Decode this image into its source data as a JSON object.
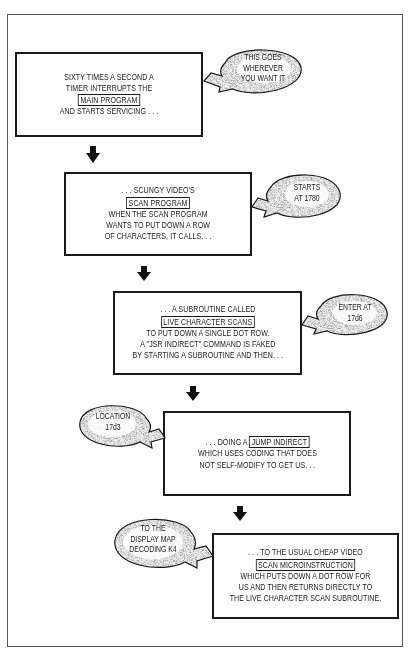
{
  "diagram": {
    "type": "flowchart",
    "steps": [
      {
        "id": "main-program",
        "lines": [
          {
            "text": "SIXTY TIMES A SECOND A"
          },
          {
            "text": "TIMER INTERRUPTS THE"
          },
          {
            "highlight": "MAIN PROGRAM"
          },
          {
            "text": "AND STARTS SERVICING . . ."
          }
        ],
        "callout": [
          "THIS GOES",
          "WHEREVER",
          "YOU WANT IT"
        ],
        "callout_side": "right"
      },
      {
        "id": "scan-program",
        "lines": [
          {
            "text": ". . . SCUNGY VIDEO'S"
          },
          {
            "highlight": "SCAN PROGRAM"
          },
          {
            "text": "WHEN THE SCAN PROGRAM"
          },
          {
            "text": "WANTS TO PUT DOWN A ROW"
          },
          {
            "text": "OF CHARACTERS, IT CALLS. . ."
          }
        ],
        "callout": [
          "STARTS",
          "AT 1780"
        ],
        "callout_side": "right"
      },
      {
        "id": "live-character-scans",
        "lines": [
          {
            "text": ". . . A SUBROUTINE CALLED"
          },
          {
            "highlight": "LIVE CHARACTER SCANS"
          },
          {
            "text": "TO PUT DOWN A SINGLE DOT ROW."
          },
          {
            "text": "A \"JSR INDIRECT\" COMMAND IS FAKED"
          },
          {
            "text": "BY STARTING A SUBROUTINE AND THEN. . ."
          }
        ],
        "callout": [
          "ENTER AT",
          "17d6"
        ],
        "callout_side": "right"
      },
      {
        "id": "jump-indirect",
        "lines": [
          {
            "prefix": ". . . DOING A ",
            "highlight": "JUMP INDIRECT"
          },
          {
            "text": "WHICH USES CODING THAT DOES"
          },
          {
            "text": "NOT SELF-MODIFY TO GET US. . ."
          }
        ],
        "callout": [
          "LOCATION",
          "17d3"
        ],
        "callout_side": "left"
      },
      {
        "id": "scan-microinstruction",
        "lines": [
          {
            "text": ". . . TO THE USUAL CHEAP VIDEO"
          },
          {
            "highlight": "SCAN MICROINSTRUCTION"
          },
          {
            "text": "WHICH PUTS DOWN A DOT ROW FOR"
          },
          {
            "text": "US AND THEN RETURNS DIRECTLY TO"
          },
          {
            "text": "THE LIVE CHARACTER SCAN SUBROUTINE."
          }
        ],
        "callout": [
          "TO THE",
          "DISPLAY MAP",
          "DECODING K4"
        ],
        "callout_side": "left"
      }
    ],
    "connectors": [
      {
        "from": "main-program",
        "to": "scan-program",
        "icon": "down-arrow-icon"
      },
      {
        "from": "scan-program",
        "to": "live-character-scans",
        "icon": "down-arrow-icon"
      },
      {
        "from": "live-character-scans",
        "to": "jump-indirect",
        "icon": "down-arrow-icon"
      },
      {
        "from": "jump-indirect",
        "to": "scan-microinstruction",
        "icon": "down-arrow-icon"
      }
    ],
    "colors": {
      "ink": "#1a1a1a",
      "background": "#ffffff",
      "bubble_fill": "#eeeeee"
    }
  }
}
